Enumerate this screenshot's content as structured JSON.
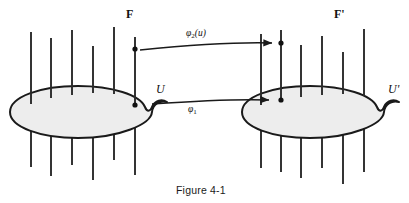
{
  "figure": {
    "caption": "Figure 4-1",
    "colors": {
      "stroke": "#1a1a1a",
      "blob_fill": "#eeeeee",
      "background": "#ffffff"
    },
    "labels": {
      "bundle_left": "F",
      "bundle_right": "F'",
      "base_left": "U",
      "base_right": "U'",
      "map_upper_main": "φ",
      "map_upper_sub": "2",
      "map_upper_arg": "(u)",
      "map_lower_main": "φ",
      "map_lower_sub": "1"
    },
    "geometry": {
      "left_blob": {
        "cx": 78,
        "cy": 112,
        "rx": 68,
        "ry": 26,
        "bump": "right"
      },
      "right_blob": {
        "cx": 310,
        "cy": 112,
        "rx": 68,
        "ry": 26,
        "bump": "right"
      },
      "left_fibers_x": [
        31,
        51,
        72,
        93,
        114,
        135
      ],
      "right_fibers_x": [
        261,
        281,
        301,
        322,
        343,
        364
      ],
      "left_marked_fiber_x": 135,
      "right_marked_fiber_x": 281,
      "upper_arrow": {
        "x1": 139,
        "y1": 49,
        "x2": 276,
        "y2": 43
      },
      "lower_arrow": {
        "x1": 152,
        "y1": 103,
        "x2": 272,
        "y2": 100
      }
    }
  }
}
